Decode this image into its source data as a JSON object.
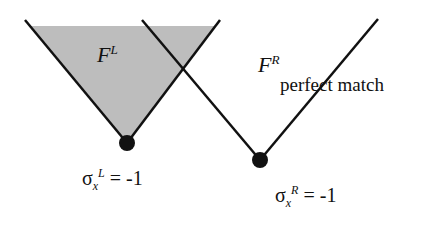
{
  "diagram": {
    "left_cone": {
      "label": "F",
      "superscript": "L",
      "fill": "#bdbdbd",
      "apex_label": {
        "symbol": "σ",
        "subscript": "x",
        "superscript": "L",
        "value": "= -1"
      }
    },
    "right_cone": {
      "label": "F",
      "superscript": "R",
      "fill": "none",
      "apex_label": {
        "symbol": "σ",
        "subscript": "x",
        "superscript": "R",
        "value": "= -1"
      }
    },
    "annotation": "perfect match",
    "colors": {
      "line": "#111111",
      "shade": "#bdbdbd",
      "background": "#ffffff"
    }
  }
}
